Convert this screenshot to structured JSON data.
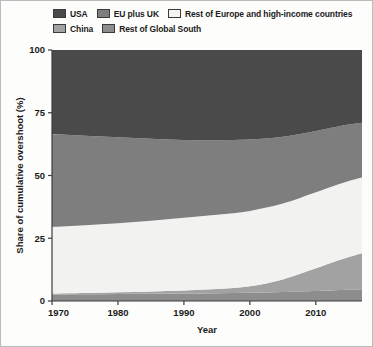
{
  "chart_data": {
    "type": "area",
    "stacked": true,
    "title": "",
    "xlabel": "Year",
    "ylabel": "Share of cumulative overshoot (%)",
    "xlim": [
      1970,
      2017
    ],
    "ylim": [
      0,
      100
    ],
    "xticks": [
      1970,
      1980,
      1990,
      2000,
      2010
    ],
    "yticks": [
      0,
      25,
      50,
      75,
      100
    ],
    "xtick_labels": [
      "1970",
      "1980",
      "1990",
      "2000",
      "2010"
    ],
    "ytick_labels": [
      "0",
      "25",
      "50",
      "75",
      "100"
    ],
    "grid": false,
    "legend_position": "top",
    "x": [
      1970,
      1975,
      1980,
      1985,
      1990,
      1995,
      2000,
      2005,
      2010,
      2013,
      2015,
      2017
    ],
    "series": [
      {
        "name": "Rest of Global South",
        "color": "#8d8d8d",
        "stack_order": 1,
        "values": [
          2.6,
          2.7,
          2.8,
          2.9,
          3.0,
          3.1,
          3.3,
          3.6,
          4.0,
          4.3,
          4.5,
          4.7
        ]
      },
      {
        "name": "China",
        "color": "#a2a2a2",
        "stack_order": 2,
        "values": [
          0.4,
          0.5,
          0.7,
          0.9,
          1.2,
          1.7,
          2.6,
          5.0,
          9.0,
          11.5,
          13.0,
          14.3
        ]
      },
      {
        "name": "Rest of Europe and high-income countries",
        "color": "#f2f2f0",
        "stack_order": 3,
        "values": [
          26.5,
          27.0,
          27.5,
          28.2,
          29.0,
          29.6,
          30.0,
          30.2,
          30.3,
          30.3,
          30.3,
          30.2
        ]
      },
      {
        "name": "EU plus UK",
        "color": "#7e7e7e",
        "stack_order": 4,
        "values": [
          37.0,
          35.6,
          34.2,
          32.6,
          30.9,
          29.6,
          28.4,
          26.6,
          24.4,
          23.2,
          22.5,
          21.8
        ]
      },
      {
        "name": "USA",
        "color": "#4a4a4a",
        "stack_order": 5,
        "values": [
          33.5,
          34.2,
          34.8,
          35.4,
          35.9,
          36.0,
          35.7,
          34.6,
          32.3,
          30.7,
          29.7,
          29.0
        ]
      }
    ]
  },
  "legend": {
    "rows": [
      [
        {
          "label": "USA",
          "color": "#4a4a4a"
        },
        {
          "label": "EU plus UK",
          "color": "#7e7e7e"
        },
        {
          "label": "Rest of Europe and high-income countries",
          "color": "#f4f4f2"
        }
      ],
      [
        {
          "label": "China",
          "color": "#a2a2a2"
        },
        {
          "label": "Rest of Global South",
          "color": "#8d8d8d"
        }
      ]
    ]
  },
  "axes": {
    "y_title": "Share of cumulative overshoot (%)",
    "x_title": "Year",
    "y_ticks": [
      "100",
      "75",
      "50",
      "25",
      "0"
    ],
    "x_ticks": [
      "1970",
      "1980",
      "1990",
      "2000",
      "2010"
    ]
  },
  "colors": {
    "usa": "#4a4a4a",
    "eu_uk": "#7e7e7e",
    "rest_europe": "#f2f2f0",
    "china": "#a2a2a2",
    "rest_global_south": "#8d8d8d",
    "axis": "#3c3c3c",
    "frame": "#b9bcbd",
    "background": "#fdfdfc"
  }
}
